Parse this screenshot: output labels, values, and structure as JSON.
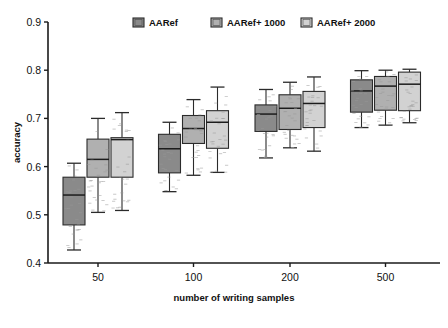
{
  "chart_data": {
    "type": "box",
    "title": "",
    "xlabel": "number of writing samples",
    "ylabel": "accuracy",
    "ylim": [
      0.4,
      0.9
    ],
    "ytick_labels": [
      "0.4",
      "0.5",
      "0.6",
      "0.7",
      "0.8",
      "0.9"
    ],
    "ytick_values": [
      0.4,
      0.5,
      0.6,
      0.7,
      0.8,
      0.9
    ],
    "categories": [
      "50",
      "100",
      "200",
      "500"
    ],
    "grid": false,
    "legend_position": "top-center",
    "legend": [
      "AARef",
      "AARef+ 1000",
      "AARef+ 2000"
    ],
    "series_colors": [
      "#8a8a8a",
      "#b0b0b0",
      "#d2d2d2"
    ],
    "series": [
      {
        "name": "AARef",
        "color": "#8a8a8a",
        "boxes": [
          {
            "category": "50",
            "whisker_low": 0.427,
            "q1": 0.479,
            "median": 0.541,
            "q3": 0.578,
            "whisker_high": 0.607
          },
          {
            "category": "100",
            "whisker_low": 0.548,
            "q1": 0.587,
            "median": 0.637,
            "q3": 0.667,
            "whisker_high": 0.692
          },
          {
            "category": "200",
            "whisker_low": 0.618,
            "q1": 0.673,
            "median": 0.709,
            "q3": 0.728,
            "whisker_high": 0.76
          },
          {
            "category": "500",
            "whisker_low": 0.681,
            "q1": 0.713,
            "median": 0.757,
            "q3": 0.78,
            "whisker_high": 0.799
          }
        ]
      },
      {
        "name": "AARef+ 1000",
        "color": "#b0b0b0",
        "boxes": [
          {
            "category": "50",
            "whisker_low": 0.505,
            "q1": 0.578,
            "median": 0.615,
            "q3": 0.657,
            "whisker_high": 0.7
          },
          {
            "category": "100",
            "whisker_low": 0.582,
            "q1": 0.648,
            "median": 0.679,
            "q3": 0.706,
            "whisker_high": 0.739
          },
          {
            "category": "200",
            "whisker_low": 0.639,
            "q1": 0.677,
            "median": 0.721,
            "q3": 0.749,
            "whisker_high": 0.775
          },
          {
            "category": "500",
            "whisker_low": 0.686,
            "q1": 0.717,
            "median": 0.767,
            "q3": 0.787,
            "whisker_high": 0.8
          }
        ]
      },
      {
        "name": "AARef+ 2000",
        "color": "#d2d2d2",
        "boxes": [
          {
            "category": "50",
            "whisker_low": 0.509,
            "q1": 0.578,
            "median": 0.656,
            "q3": 0.66,
            "whisker_high": 0.712
          },
          {
            "category": "100",
            "whisker_low": 0.588,
            "q1": 0.638,
            "median": 0.692,
            "q3": 0.716,
            "whisker_high": 0.765
          },
          {
            "category": "200",
            "whisker_low": 0.632,
            "q1": 0.681,
            "median": 0.731,
            "q3": 0.756,
            "whisker_high": 0.786
          },
          {
            "category": "500",
            "whisker_low": 0.691,
            "q1": 0.716,
            "median": 0.771,
            "q3": 0.796,
            "whisker_high": 0.802
          }
        ]
      }
    ]
  }
}
